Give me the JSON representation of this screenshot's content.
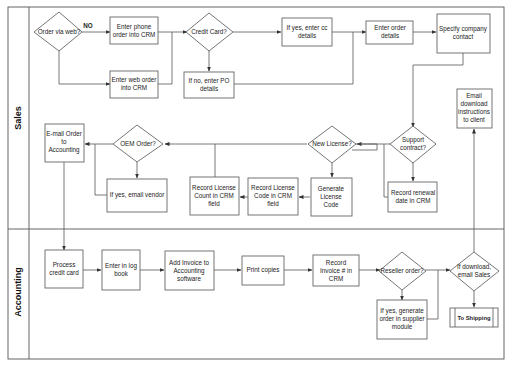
{
  "lanes": [
    {
      "id": "sales",
      "label": "Sales"
    },
    {
      "id": "accounting",
      "label": "Accounting"
    }
  ],
  "nodes": {
    "order_via_web": {
      "type": "decision",
      "lines": [
        "Order via web?"
      ],
      "lane": "sales"
    },
    "no_label": {
      "type": "label",
      "lines": [
        "NO"
      ]
    },
    "enter_phone_order": {
      "type": "process",
      "lines": [
        "Enter phone",
        "order into CRM"
      ],
      "lane": "sales"
    },
    "enter_web_order": {
      "type": "process",
      "lines": [
        "Enter web order",
        "into CRM"
      ],
      "lane": "sales"
    },
    "credit_card": {
      "type": "decision",
      "lines": [
        "Credit Card?"
      ],
      "lane": "sales"
    },
    "if_no_po": {
      "type": "process",
      "lines": [
        "If no, enter PO",
        "details"
      ],
      "lane": "sales"
    },
    "if_yes_cc": {
      "type": "process",
      "lines": [
        "If yes, enter cc",
        "details"
      ],
      "lane": "sales"
    },
    "enter_order_details": {
      "type": "process",
      "lines": [
        "Enter order",
        "details"
      ],
      "lane": "sales"
    },
    "specify_company_contact": {
      "type": "process",
      "lines": [
        "Specify company",
        "contact"
      ],
      "lane": "sales"
    },
    "support_contract": {
      "type": "decision",
      "lines": [
        "Support",
        "contract?"
      ],
      "lane": "sales"
    },
    "record_renewal_date": {
      "type": "process",
      "lines": [
        "Record renewal",
        "date in CRM"
      ],
      "lane": "sales"
    },
    "new_license": {
      "type": "decision",
      "lines": [
        "New License?"
      ],
      "lane": "sales"
    },
    "generate_license_code": {
      "type": "process",
      "lines": [
        "Generate",
        "License",
        "Code"
      ],
      "lane": "sales"
    },
    "record_license_code": {
      "type": "process",
      "lines": [
        "Record License",
        "Code in CRM",
        "field"
      ],
      "lane": "sales"
    },
    "record_license_count": {
      "type": "process",
      "lines": [
        "Record License",
        "Count in CRM",
        "field"
      ],
      "lane": "sales"
    },
    "oem_order": {
      "type": "decision",
      "lines": [
        "OEM Order?"
      ],
      "lane": "sales"
    },
    "if_yes_email_vendor": {
      "type": "process",
      "lines": [
        "If yes, email vendor"
      ],
      "lane": "sales"
    },
    "email_order_accounting": {
      "type": "process",
      "lines": [
        "E-mail Order",
        "to",
        "Accounting"
      ],
      "lane": "sales"
    },
    "email_download_instructions": {
      "type": "process",
      "lines": [
        "Email",
        "download",
        "instructions",
        "to client"
      ],
      "lane": "sales"
    },
    "process_credit_card": {
      "type": "process",
      "lines": [
        "Process",
        "credit card"
      ],
      "lane": "accounting"
    },
    "enter_log_book": {
      "type": "process",
      "lines": [
        "Enter in log",
        "book"
      ],
      "lane": "accounting"
    },
    "add_invoice": {
      "type": "process",
      "lines": [
        "Add Invoice to",
        "Accounting",
        "software"
      ],
      "lane": "accounting"
    },
    "print_copies": {
      "type": "process",
      "lines": [
        "Print copies"
      ],
      "lane": "accounting"
    },
    "record_invoice": {
      "type": "process",
      "lines": [
        "Record",
        "Invoice # in",
        "CRM"
      ],
      "lane": "accounting"
    },
    "reseller_order": {
      "type": "decision",
      "lines": [
        "Reseller order?"
      ],
      "lane": "accounting"
    },
    "if_yes_supplier": {
      "type": "process",
      "lines": [
        "If yes, generate",
        "order in supplier",
        "module"
      ],
      "lane": "accounting"
    },
    "if_download_email": {
      "type": "decision",
      "lines": [
        "If download,",
        "email Sales"
      ],
      "lane": "accounting"
    },
    "to_shipping": {
      "type": "subprocess",
      "lines": [
        "To Shipping"
      ],
      "lane": "accounting"
    }
  }
}
